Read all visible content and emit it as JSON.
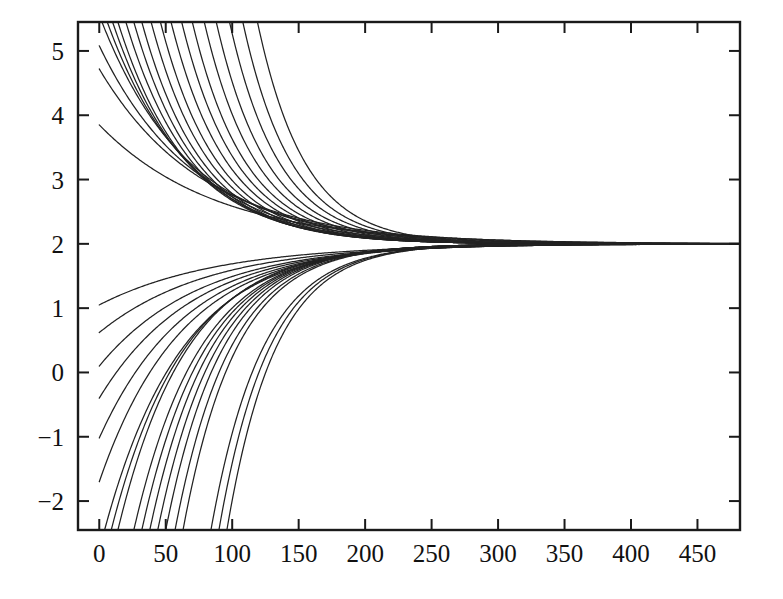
{
  "chart_data": {
    "type": "line",
    "title": "",
    "subtitle": "",
    "xlabel": "",
    "ylabel": "",
    "xlim": [
      -16,
      482
    ],
    "ylim": [
      -2.45,
      5.45
    ],
    "grid": false,
    "legend": null,
    "asymptote": 2,
    "xticks": [
      0,
      50,
      100,
      150,
      200,
      250,
      300,
      350,
      400,
      450
    ],
    "xticklabels": [
      "0",
      "50",
      "100",
      "150",
      "200",
      "250",
      "300",
      "350",
      "400",
      "450"
    ],
    "yticks": [
      -2,
      -1,
      0,
      1,
      2,
      3,
      4,
      5
    ],
    "yticklabels": [
      "-2",
      "-1",
      "0",
      "1",
      "2",
      "3",
      "4",
      "5"
    ],
    "series": [
      {
        "name": "curve-01",
        "y0": 3.85,
        "x0": 0,
        "k": 0.0115
      },
      {
        "name": "curve-02",
        "y0": 4.72,
        "x0": 0,
        "k": 0.0128
      },
      {
        "name": "curve-03",
        "y0": 5.08,
        "x0": 0,
        "k": 0.014
      },
      {
        "name": "curve-04",
        "y0": 5.45,
        "x0": 2,
        "k": 0.0152
      },
      {
        "name": "curve-05",
        "y0": 5.45,
        "x0": 6,
        "k": 0.0165
      },
      {
        "name": "curve-06",
        "y0": 5.45,
        "x0": 10,
        "k": 0.0178
      },
      {
        "name": "curve-07",
        "y0": 5.45,
        "x0": 14,
        "k": 0.019
      },
      {
        "name": "curve-08",
        "y0": 5.45,
        "x0": 20,
        "k": 0.02
      },
      {
        "name": "curve-09",
        "y0": 5.45,
        "x0": 26,
        "k": 0.021
      },
      {
        "name": "curve-10",
        "y0": 5.45,
        "x0": 32,
        "k": 0.0218
      },
      {
        "name": "curve-11",
        "y0": 5.45,
        "x0": 39,
        "k": 0.0225
      },
      {
        "name": "curve-12",
        "y0": 5.45,
        "x0": 46,
        "k": 0.0232
      },
      {
        "name": "curve-13",
        "y0": 5.45,
        "x0": 54,
        "k": 0.0238
      },
      {
        "name": "curve-14",
        "y0": 5.45,
        "x0": 62,
        "k": 0.0244
      },
      {
        "name": "curve-15",
        "y0": 5.45,
        "x0": 70,
        "k": 0.025
      },
      {
        "name": "curve-16",
        "y0": 5.45,
        "x0": 79,
        "k": 0.0256
      },
      {
        "name": "curve-17",
        "y0": 5.45,
        "x0": 88,
        "k": 0.0262
      },
      {
        "name": "curve-18",
        "y0": 5.45,
        "x0": 98,
        "k": 0.0268
      },
      {
        "name": "curve-19",
        "y0": 5.45,
        "x0": 108,
        "k": 0.0274
      },
      {
        "name": "curve-20",
        "y0": 5.45,
        "x0": 119,
        "k": 0.028
      },
      {
        "name": "curve-21",
        "y0": 1.05,
        "x0": 0,
        "k": 0.0112
      },
      {
        "name": "curve-22",
        "y0": 0.62,
        "x0": 0,
        "k": 0.0122
      },
      {
        "name": "curve-23",
        "y0": 0.1,
        "x0": 0,
        "k": 0.0132
      },
      {
        "name": "curve-24",
        "y0": -0.4,
        "x0": 0,
        "k": 0.0142
      },
      {
        "name": "curve-25",
        "y0": -1.02,
        "x0": 0,
        "k": 0.0152
      },
      {
        "name": "curve-26",
        "y0": -1.7,
        "x0": 0,
        "k": 0.0162
      },
      {
        "name": "curve-27",
        "y0": -2.45,
        "x0": 4,
        "k": 0.0172
      },
      {
        "name": "curve-28",
        "y0": -2.45,
        "x0": 9,
        "k": 0.0182
      },
      {
        "name": "curve-29",
        "y0": -2.45,
        "x0": 14,
        "k": 0.0192
      },
      {
        "name": "curve-30",
        "y0": -2.45,
        "x0": 26,
        "k": 0.0202
      },
      {
        "name": "curve-31",
        "y0": -2.45,
        "x0": 32,
        "k": 0.021
      },
      {
        "name": "curve-32",
        "y0": -2.45,
        "x0": 38,
        "k": 0.0218
      },
      {
        "name": "curve-33",
        "y0": -2.45,
        "x0": 44,
        "k": 0.0226
      },
      {
        "name": "curve-34",
        "y0": -2.45,
        "x0": 50,
        "k": 0.0234
      },
      {
        "name": "curve-35",
        "y0": -2.45,
        "x0": 57,
        "k": 0.0242
      },
      {
        "name": "curve-36",
        "y0": -2.45,
        "x0": 63,
        "k": 0.025
      },
      {
        "name": "curve-37",
        "y0": -2.45,
        "x0": 84,
        "k": 0.0258
      },
      {
        "name": "curve-38",
        "y0": -2.45,
        "x0": 90,
        "k": 0.0266
      },
      {
        "name": "curve-39",
        "y0": -2.45,
        "x0": 96,
        "k": 0.0274
      }
    ]
  },
  "colors": {
    "background": "#ffffff",
    "axis": "#1a1a1a",
    "curve": "#222222"
  }
}
